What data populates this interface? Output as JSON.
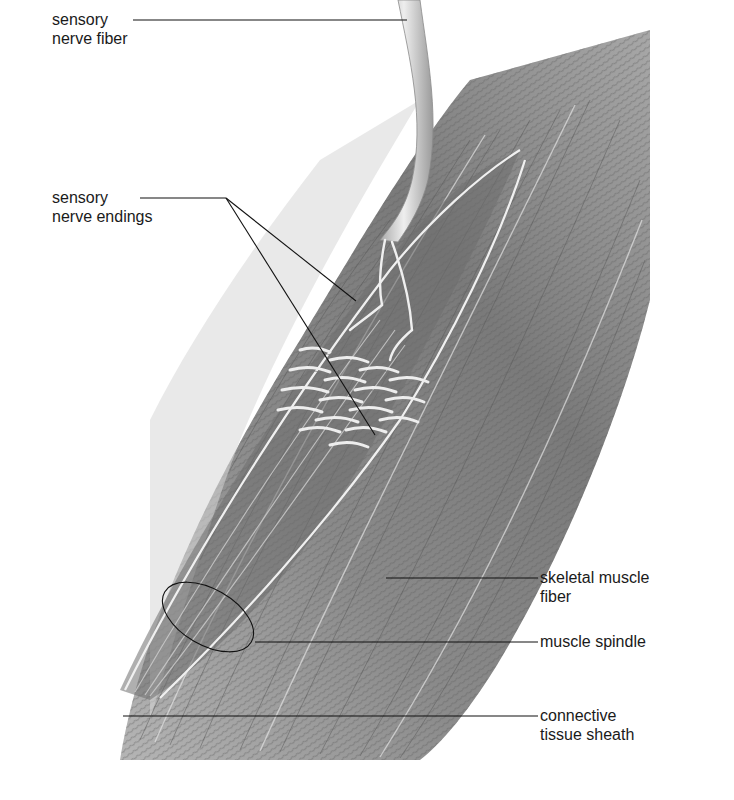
{
  "figure": {
    "colors": {
      "background": "#ffffff",
      "muscle_dark": "#6f6f6f",
      "muscle_mid": "#9a9a9a",
      "muscle_light": "#c9c9c9",
      "nerve_fill": "#d8d8d8",
      "nerve_highlight": "#f2f2f2",
      "leader_line": "#111111",
      "label_text": "#1a1a1a"
    }
  },
  "labels": {
    "sensory_nerve_fiber": {
      "line1": "sensory",
      "line2": "nerve fiber"
    },
    "sensory_nerve_endings": {
      "line1": "sensory",
      "line2": "nerve endings"
    },
    "skeletal_muscle_fiber": {
      "line1": "skeletal muscle",
      "line2": "fiber"
    },
    "muscle_spindle": {
      "line1": "muscle spindle"
    },
    "connective_tissue_sheath": {
      "line1": "connective",
      "line2": "tissue sheath"
    }
  }
}
